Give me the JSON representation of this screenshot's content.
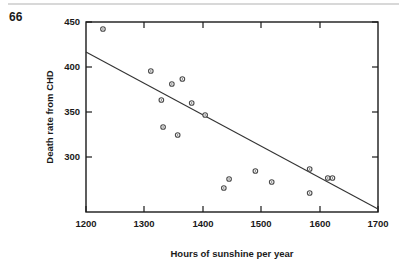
{
  "page": {
    "number": "66"
  },
  "chart_data": {
    "type": "scatter",
    "title": "",
    "xlabel": "Hours of sunshine per year",
    "ylabel": "Death rate from CHD",
    "xlim": [
      1200,
      1700
    ],
    "ylim": [
      260,
      450
    ],
    "xticks": [
      1200,
      1300,
      1400,
      1500,
      1600,
      1700
    ],
    "yticks": [
      300,
      350,
      400,
      450
    ],
    "xtick_labels": [
      "1200",
      "1300",
      "1400",
      "1500",
      "1600",
      "1700"
    ],
    "ytick_labels": [
      "300",
      "350",
      "400",
      "450"
    ],
    "grid": false,
    "legend": null,
    "marker": "open-circle",
    "points": [
      {
        "x": 1229,
        "y": 443
      },
      {
        "x": 1311,
        "y": 401
      },
      {
        "x": 1329,
        "y": 372
      },
      {
        "x": 1347,
        "y": 388
      },
      {
        "x": 1365,
        "y": 393
      },
      {
        "x": 1381,
        "y": 369
      },
      {
        "x": 1404,
        "y": 357
      },
      {
        "x": 1332,
        "y": 345
      },
      {
        "x": 1357,
        "y": 337
      },
      {
        "x": 1436,
        "y": 284
      },
      {
        "x": 1445,
        "y": 293
      },
      {
        "x": 1490,
        "y": 301
      },
      {
        "x": 1518,
        "y": 290
      },
      {
        "x": 1583,
        "y": 279
      },
      {
        "x": 1583,
        "y": 303
      },
      {
        "x": 1614,
        "y": 294
      },
      {
        "x": 1622,
        "y": 294
      }
    ],
    "trendline": {
      "x_start": 1200,
      "y_start": 420,
      "x_end": 1700,
      "y_end": 263
    }
  }
}
